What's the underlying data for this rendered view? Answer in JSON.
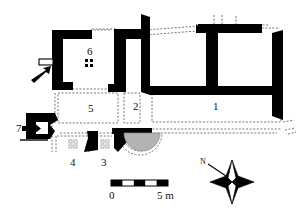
{
  "figure": {
    "kind": "archaeological-site-plan",
    "colors": {
      "wall_fill": "#000000",
      "background": "#ffffff",
      "apse_fill": "#b3b3b3",
      "reconstruction_line": "#555555",
      "text": "#111111",
      "dot_pattern_light": "#cccccc",
      "dot_pattern_dark": "#000000"
    }
  },
  "room_labels": [
    {
      "id": "room-1",
      "text": "1",
      "x": 213,
      "y": 101
    },
    {
      "id": "room-2",
      "text": "2",
      "x": 133,
      "y": 101
    },
    {
      "id": "room-3",
      "text": "3",
      "x": 101,
      "y": 157
    },
    {
      "id": "room-4",
      "text": "4",
      "x": 70,
      "y": 157
    },
    {
      "id": "room-5",
      "text": "5",
      "x": 88,
      "y": 103
    },
    {
      "id": "room-6",
      "text": "6",
      "x": 87,
      "y": 46
    },
    {
      "id": "room-7",
      "text": "7",
      "x": 16,
      "y": 128
    }
  ],
  "scale_bar": {
    "start_label": "0",
    "end_label": "5 m",
    "units": "m",
    "total_meters": 5,
    "segments": 5,
    "segment_colors": [
      "#000000",
      "#ffffff",
      "#000000",
      "#ffffff",
      "#000000"
    ],
    "x": 111,
    "y": 180,
    "width": 57,
    "height": 6
  },
  "north_arrow": {
    "label": "N",
    "style": "four-point-compass-star",
    "center_x": 232,
    "center_y": 182
  },
  "entrance_arrows": [
    {
      "id": "entrance-arrow-west-room6",
      "x": 33,
      "y": 73,
      "direction": "northeast"
    },
    {
      "id": "entrance-arrow-room7",
      "x": 20,
      "y": 128,
      "direction": "east"
    }
  ]
}
